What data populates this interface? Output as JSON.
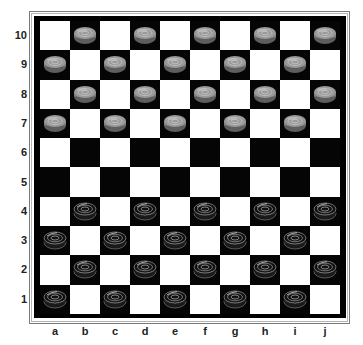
{
  "board": {
    "size": 10,
    "files": [
      "a",
      "b",
      "c",
      "d",
      "e",
      "f",
      "g",
      "h",
      "i",
      "j"
    ],
    "ranks": [
      "10",
      "9",
      "8",
      "7",
      "6",
      "5",
      "4",
      "3",
      "2",
      "1"
    ],
    "colors": {
      "light_square": "#ffffff",
      "dark_square": "#050505",
      "white_piece": "#9a9a9a",
      "black_piece": "#111111"
    },
    "pieces": {
      "white": [
        "b10",
        "d10",
        "f10",
        "h10",
        "j10",
        "a9",
        "c9",
        "e9",
        "g9",
        "i9",
        "b8",
        "d8",
        "f8",
        "h8",
        "j8",
        "a7",
        "c7",
        "e7",
        "g7",
        "i7"
      ],
      "black": [
        "b4",
        "d4",
        "f4",
        "h4",
        "j4",
        "a3",
        "c3",
        "e3",
        "g3",
        "i3",
        "b2",
        "d2",
        "f2",
        "h2",
        "j2",
        "a1",
        "c1",
        "e1",
        "g1",
        "i1"
      ]
    }
  }
}
